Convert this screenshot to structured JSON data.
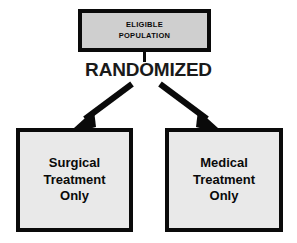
{
  "diagram": {
    "type": "flowchart",
    "background_color": "#ffffff",
    "nodes": [
      {
        "id": "eligible-population",
        "label": "ELIGIBLE\nPOPULATION",
        "line1": "ELIGIBLE",
        "line2": "POPULATION",
        "fill_color": "#cfcfcf",
        "border_color": "#0a0a0a",
        "text_color": "#0a0a0a",
        "text_transform": "uppercase"
      },
      {
        "id": "surgical-treatment-only",
        "label": "Surgical Treatment Only",
        "line1": "Surgical",
        "line2": "Treatment",
        "line3": "Only",
        "fill_color": "#e9e9e9",
        "border_color": "#0a0a0a",
        "text_color": "#0a0a0a"
      },
      {
        "id": "medical-treatment-only",
        "label": "Medical Treatment Only",
        "line1": "Medical",
        "line2": "Treatment",
        "line3": "Only",
        "fill_color": "#e9e9e9",
        "border_color": "#0a0a0a",
        "text_color": "#0a0a0a"
      }
    ],
    "process_label": {
      "id": "randomized",
      "text": "RANDOMIZED",
      "color": "#1a1a1a"
    },
    "edges": [
      {
        "id": "connector-eligible-to-randomized",
        "from": "eligible-population",
        "to": "randomized",
        "style": "plain-line",
        "color": "#0a0a0a"
      },
      {
        "id": "arrow-randomized-to-surgical",
        "from": "randomized",
        "to": "surgical-treatment-only",
        "style": "solid-arrow",
        "direction": "down-left",
        "color": "#0a0a0a"
      },
      {
        "id": "arrow-randomized-to-medical",
        "from": "randomized",
        "to": "medical-treatment-only",
        "style": "solid-arrow",
        "direction": "down-right",
        "color": "#0a0a0a"
      }
    ]
  }
}
